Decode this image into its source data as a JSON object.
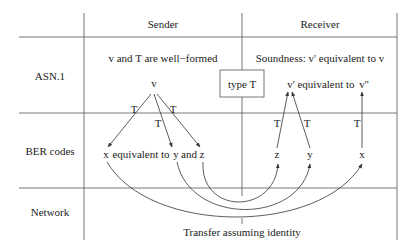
{
  "columns": {
    "sender": "Sender",
    "receiver": "Receiver"
  },
  "rows": {
    "asn1": "ASN.1",
    "ber": "BER codes",
    "network": "Network"
  },
  "sender": {
    "wellformed": "v and T are well−formed",
    "v": "v",
    "t_left": "T",
    "t_mid": "T",
    "t_right": "T",
    "x": "x",
    "equiv_text": "equivalent to",
    "y": "y",
    "and_text": "and",
    "z": "z"
  },
  "center": {
    "type_box": "type T"
  },
  "receiver": {
    "soundness": "Soundness: v' equivalent to v",
    "vprime": "v'",
    "equiv_text": "equivalent to",
    "vdoubleprime": "v''",
    "t_z": "T",
    "t_y": "T",
    "t_x": "T",
    "z": "z",
    "y": "y",
    "x": "x"
  },
  "network": {
    "transfer": "Transfer assuming identity"
  }
}
